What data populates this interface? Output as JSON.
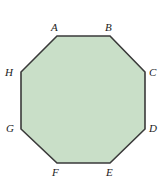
{
  "figure": {
    "name": "regular-octagon",
    "shape_type": "octagon",
    "fill_color": "#c9dfc8",
    "stroke_color": "#3a3a3a",
    "stroke_width": 1.6,
    "background_color": "#ffffff",
    "vertices": [
      {
        "id": "A",
        "label": "A",
        "x": 57,
        "y": 36
      },
      {
        "id": "B",
        "label": "B",
        "x": 110,
        "y": 36
      },
      {
        "id": "C",
        "label": "C",
        "x": 145,
        "y": 72
      },
      {
        "id": "D",
        "label": "D",
        "x": 145,
        "y": 129
      },
      {
        "id": "E",
        "label": "E",
        "x": 110,
        "y": 163
      },
      {
        "id": "F",
        "label": "F",
        "x": 57,
        "y": 163
      },
      {
        "id": "G",
        "label": "G",
        "x": 21,
        "y": 129
      },
      {
        "id": "H",
        "label": "H",
        "x": 21,
        "y": 72
      }
    ],
    "polygon_points": "57,36 110,36 145,72 145,129 110,163 57,163 21,129 21,72"
  }
}
